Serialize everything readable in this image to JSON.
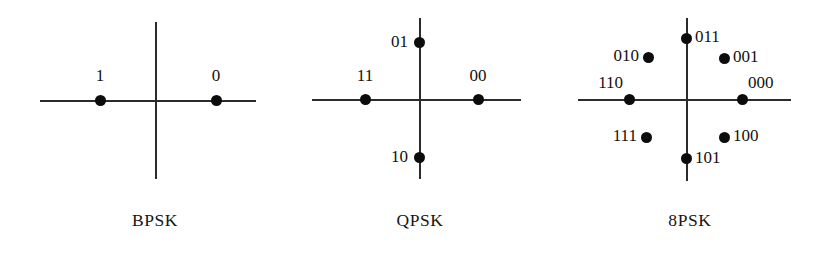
{
  "figure": {
    "background": "#ffffff",
    "ink": "#111111",
    "dot_color": "#0c0c0c",
    "axis_color": "#2b2b2b"
  },
  "chart_data": {
    "type": "scatter",
    "xlabel": "",
    "ylabel": "",
    "grid": false,
    "legend": "none",
    "panels": [
      {
        "name": "bpsk",
        "caption": "BPSK",
        "order": 2,
        "bits_per_symbol": 1,
        "axis": {
          "h_start_px": 40,
          "h_end_px": 256,
          "h_y_px": 100,
          "v_start_px": 22,
          "v_end_px": 179,
          "v_x_px": 155
        },
        "points": [
          {
            "label": "1",
            "angle_deg": 180,
            "x_px": 100,
            "y_px": 100,
            "label_x_px": 100,
            "label_y_px": 76,
            "label_align": "center"
          },
          {
            "label": "0",
            "angle_deg": 0,
            "x_px": 216,
            "y_px": 100,
            "label_x_px": 216,
            "label_y_px": 76,
            "label_align": "center"
          }
        ],
        "caption_center_px": 155,
        "caption_y_px": 210
      },
      {
        "name": "qpsk",
        "caption": "QPSK",
        "order": 4,
        "bits_per_symbol": 2,
        "axis": {
          "h_start_px": 312,
          "h_end_px": 521,
          "h_y_px": 99,
          "v_start_px": 18,
          "v_end_px": 179,
          "v_x_px": 419
        },
        "points": [
          {
            "label": "01",
            "angle_deg": 90,
            "x_px": 419,
            "y_px": 42,
            "label_x_px": 408,
            "label_y_px": 42,
            "label_align": "right"
          },
          {
            "label": "11",
            "angle_deg": 180,
            "x_px": 365,
            "y_px": 99,
            "label_x_px": 365,
            "label_y_px": 76,
            "label_align": "center"
          },
          {
            "label": "00",
            "angle_deg": 0,
            "x_px": 478,
            "y_px": 99,
            "label_x_px": 478,
            "label_y_px": 76,
            "label_align": "center"
          },
          {
            "label": "10",
            "angle_deg": 270,
            "x_px": 419,
            "y_px": 157,
            "label_x_px": 408,
            "label_y_px": 157,
            "label_align": "right"
          }
        ],
        "caption_center_px": 420,
        "caption_y_px": 210
      },
      {
        "name": "8psk",
        "caption": "8PSK",
        "order": 8,
        "bits_per_symbol": 3,
        "axis": {
          "h_start_px": 578,
          "h_end_px": 791,
          "h_y_px": 99,
          "v_start_px": 18,
          "v_end_px": 181,
          "v_x_px": 686
        },
        "points": [
          {
            "label": "011",
            "angle_deg": 90,
            "x_px": 686,
            "y_px": 38,
            "label_x_px": 695,
            "label_y_px": 37,
            "label_align": "left"
          },
          {
            "label": "010",
            "angle_deg": 135,
            "x_px": 648,
            "y_px": 57,
            "label_x_px": 639,
            "label_y_px": 56,
            "label_align": "right"
          },
          {
            "label": "001",
            "angle_deg": 45,
            "x_px": 724,
            "y_px": 58,
            "label_x_px": 733,
            "label_y_px": 57,
            "label_align": "left"
          },
          {
            "label": "110",
            "angle_deg": 180,
            "x_px": 629,
            "y_px": 99,
            "label_x_px": 623,
            "label_y_px": 83,
            "label_align": "right"
          },
          {
            "label": "000",
            "angle_deg": 0,
            "x_px": 742,
            "y_px": 99,
            "label_x_px": 748,
            "label_y_px": 83,
            "label_align": "left"
          },
          {
            "label": "111",
            "angle_deg": 225,
            "x_px": 646,
            "y_px": 137,
            "label_x_px": 637,
            "label_y_px": 136,
            "label_align": "right"
          },
          {
            "label": "100",
            "angle_deg": 315,
            "x_px": 724,
            "y_px": 137,
            "label_x_px": 733,
            "label_y_px": 136,
            "label_align": "left"
          },
          {
            "label": "101",
            "angle_deg": 270,
            "x_px": 686,
            "y_px": 158,
            "label_x_px": 695,
            "label_y_px": 158,
            "label_align": "left"
          }
        ],
        "caption_center_px": 690,
        "caption_y_px": 210
      }
    ]
  }
}
